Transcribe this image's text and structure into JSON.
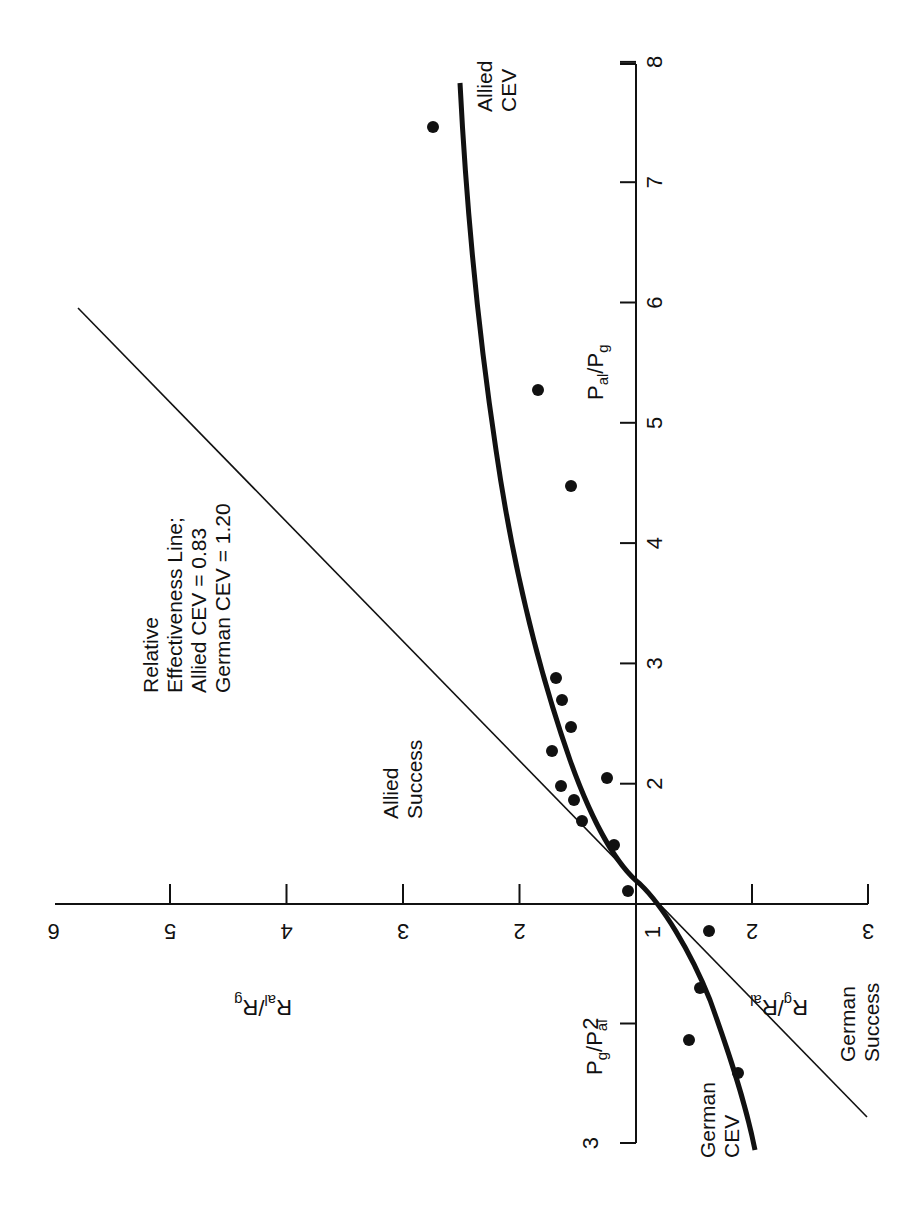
{
  "chart_data": {
    "type": "scatter",
    "orientation_note": "figure printed rotated 90 degrees counter-clockwise",
    "title": "",
    "axes": {
      "up": {
        "label": "P_al/P_g",
        "label_main": "P",
        "label_sub1": "al",
        "label_sep": "/P",
        "label_sub2": "g",
        "ticks": [
          2,
          3,
          4,
          5,
          6,
          7,
          8
        ]
      },
      "down": {
        "label": "P_g/P_al",
        "label_main": "P",
        "label_sub1": "g",
        "label_sep": "/P",
        "label_sub2": "al",
        "ticks": [
          2,
          3
        ]
      },
      "left": {
        "label": "R_al/R_g",
        "label_main": "R",
        "label_sub1": "al",
        "label_sep": "/R",
        "label_sub2": "g",
        "ticks": [
          2,
          3,
          4,
          5,
          6
        ]
      },
      "right": {
        "label": "R_g/R_al",
        "label_main": "R",
        "label_sub1": "g",
        "label_sep": "/R",
        "label_sub2": "al",
        "ticks": [
          2,
          3
        ]
      },
      "origin_label": "1"
    },
    "series": [
      {
        "name": "Engagements",
        "kind": "points",
        "note": "x: + = R_al/R_g side (left), - = R_g/R_al side (right) expressed as signed log-free offsets; y: + = P_al/P_g, - = P_g/P_al",
        "points": [
          {
            "r_side": "al",
            "r": 2.74,
            "p_side": "al",
            "p": 7.48
          },
          {
            "r_side": "al",
            "r": 1.84,
            "p_side": "al",
            "p": 5.3
          },
          {
            "r_side": "al",
            "r": 1.56,
            "p_side": "al",
            "p": 4.49
          },
          {
            "r_side": "al",
            "r": 1.69,
            "p_side": "al",
            "p": 2.88
          },
          {
            "r_side": "al",
            "r": 1.64,
            "p_side": "al",
            "p": 2.69
          },
          {
            "r_side": "al",
            "r": 1.56,
            "p_side": "al",
            "p": 2.47
          },
          {
            "r_side": "al",
            "r": 1.72,
            "p_side": "al",
            "p": 2.27
          },
          {
            "r_side": "al",
            "r": 1.25,
            "p_side": "al",
            "p": 2.05
          },
          {
            "r_side": "al",
            "r": 1.64,
            "p_side": "al",
            "p": 1.98
          },
          {
            "r_side": "al",
            "r": 1.53,
            "p_side": "al",
            "p": 1.86
          },
          {
            "r_side": "al",
            "r": 1.46,
            "p_side": "al",
            "p": 1.69
          },
          {
            "r_side": "al",
            "r": 1.19,
            "p_side": "al",
            "p": 1.49
          },
          {
            "r_side": "al",
            "r": 1.07,
            "p_side": "al",
            "p": 1.11
          },
          {
            "r_side": "g",
            "r": 1.63,
            "p_side": "g",
            "p": 1.23
          },
          {
            "r_side": "g",
            "r": 1.55,
            "p_side": "g",
            "p": 1.7
          },
          {
            "r_side": "g",
            "r": 1.46,
            "p_side": "g",
            "p": 2.13
          },
          {
            "r_side": "g",
            "r": 1.88,
            "p_side": "g",
            "p": 2.41
          }
        ],
        "pixels": [
          [
            433,
            127
          ],
          [
            538,
            390
          ],
          [
            571,
            486
          ],
          [
            556,
            678
          ],
          [
            562,
            700
          ],
          [
            571,
            727
          ],
          [
            552,
            751
          ],
          [
            607,
            778
          ],
          [
            561,
            786
          ],
          [
            574,
            800
          ],
          [
            582,
            821
          ],
          [
            614,
            845
          ],
          [
            628,
            891
          ],
          [
            709,
            931
          ],
          [
            700,
            988
          ],
          [
            689,
            1040
          ],
          [
            738,
            1073
          ]
        ]
      },
      {
        "name": "CEV curve",
        "kind": "thick-curve",
        "path": "M460,83 C466,200 478,330 496,450 C512,560 535,660 570,760 C595,830 620,868 640,884 C662,905 690,950 710,1000 C728,1050 745,1100 755,1150"
      },
      {
        "name": "Relative Effectiveness Line",
        "kind": "thin-line",
        "from": [
          78,
          308
        ],
        "to": [
          867,
          1117
        ]
      }
    ],
    "annotations": {
      "relative_line": [
        "Relative",
        "Effectiveness  Line;",
        "Allied CEV = 0.83",
        "German CEV = 1.20"
      ],
      "allied_success": [
        "Allied",
        "Success"
      ],
      "german_success": [
        "German",
        "Success"
      ],
      "allied_cev": [
        "Allied",
        "CEV"
      ],
      "german_cev": [
        "German",
        "CEV"
      ]
    },
    "allied_cev_value": "0.83",
    "german_cev_value": "1.20",
    "grid": false,
    "legend": "none"
  },
  "colors": {
    "ink": "#111111",
    "background": "#ffffff"
  }
}
